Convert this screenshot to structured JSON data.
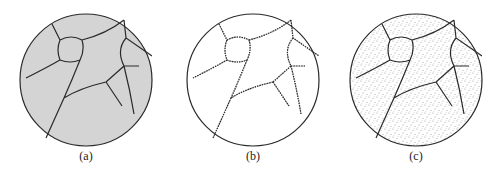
{
  "figure": {
    "panels": [
      {
        "id": "a",
        "label": "(a)",
        "style": "uniform-gray-fill",
        "fill": "#d4d4d4"
      },
      {
        "id": "b",
        "label": "(b)",
        "style": "white-with-hairy-boundaries",
        "fill": "#ffffff"
      },
      {
        "id": "c",
        "label": "(c)",
        "style": "stippled-dots",
        "fill": "#ffffff"
      }
    ],
    "line_color": "#2a2a2a"
  }
}
